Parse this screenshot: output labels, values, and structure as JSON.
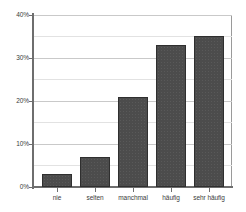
{
  "chart_data": {
    "type": "bar",
    "title": "",
    "subtitle": "",
    "xlabel": "",
    "ylabel": "",
    "categories": [
      "nie",
      "selten",
      "manchmal",
      "häufig",
      "sehr häufig"
    ],
    "values": [
      3,
      7,
      21,
      33,
      35
    ],
    "value_suffix": "%",
    "ylim": [
      0,
      40
    ],
    "y_ticks": [
      0,
      10,
      20,
      30,
      40
    ],
    "y_tick_labels": [
      "0%",
      "10%",
      "20%",
      "30%",
      "40%"
    ],
    "y_minor_ticks": [
      5,
      15,
      25,
      35
    ],
    "grid": true,
    "grid_axis": "y",
    "legend": false,
    "legend_position": "none",
    "bar_color": "#4c4c4c",
    "bar_edge_color": "#2f2f2f",
    "grid_color": "#c9c9c9",
    "axis_color": "#6e6e6e",
    "background_color": "#ffffff",
    "text_color": "#3b3b3b"
  }
}
